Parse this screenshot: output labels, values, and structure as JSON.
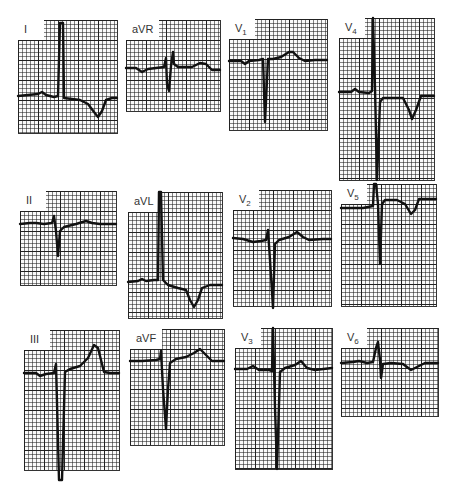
{
  "figure": {
    "leads": [
      {
        "id": "I",
        "label": "I",
        "sub": "",
        "x": 18,
        "y": 20,
        "w": 99,
        "h": 113,
        "labelW": 14
      },
      {
        "id": "aVR",
        "label": "aVR",
        "sub": "",
        "x": 126,
        "y": 20,
        "w": 94,
        "h": 91,
        "labelW": 26
      },
      {
        "id": "V1",
        "label": "V",
        "sub": "1",
        "x": 229,
        "y": 19,
        "w": 98,
        "h": 111,
        "labelW": 22
      },
      {
        "id": "V4",
        "label": "V",
        "sub": "4",
        "x": 339,
        "y": 18,
        "w": 95,
        "h": 162,
        "labelW": 22
      },
      {
        "id": "II",
        "label": "II",
        "sub": "",
        "x": 20,
        "y": 191,
        "w": 96,
        "h": 94,
        "labelW": 20
      },
      {
        "id": "aVL",
        "label": "aVL",
        "sub": "",
        "x": 128,
        "y": 192,
        "w": 94,
        "h": 126,
        "labelW": 26
      },
      {
        "id": "V2",
        "label": "V",
        "sub": "2",
        "x": 233,
        "y": 190,
        "w": 98,
        "h": 116,
        "labelW": 22
      },
      {
        "id": "V5",
        "label": "V",
        "sub": "5",
        "x": 341,
        "y": 184,
        "w": 95,
        "h": 122,
        "labelW": 22
      },
      {
        "id": "III",
        "label": "III",
        "sub": "",
        "x": 24,
        "y": 330,
        "w": 95,
        "h": 140,
        "labelW": 20
      },
      {
        "id": "aVF",
        "label": "aVF",
        "sub": "",
        "x": 130,
        "y": 329,
        "w": 94,
        "h": 116,
        "labelW": 26
      },
      {
        "id": "V3",
        "label": "V",
        "sub": "3",
        "x": 235,
        "y": 328,
        "w": 97,
        "h": 141,
        "labelW": 22
      },
      {
        "id": "V6",
        "label": "V",
        "sub": "6",
        "x": 341,
        "y": 328,
        "w": 97,
        "h": 88,
        "labelW": 22
      }
    ]
  },
  "traces": {
    "I": "M0,76 L20,74 L24,72 L28,75 L36,77 L40,76 L42,3 L45,3 L46,78 L54,79 L62,80 L70,84 L76,92 L80,97 L84,91 L88,80 L94,78 L99,78",
    "aVR": "M0,48 L10,48 L16,52 L22,49 L30,48 L38,47 L40,38 L41,64 L43,71 L45,46 L47,32 L48,44 L52,47 L66,47 L74,43 L80,44 L86,50 L94,50",
    "V1": "M0,42 L12,42 L16,45 L20,42 L30,41 L34,40 L36,103 L39,40 L44,40 L52,38 L60,33 L64,33 L70,39 L76,42 L86,41 L98,41",
    "V4": "M0,74 L12,74 L16,71 L20,74 L30,75 L33,73 L34,0 L36,70 L38,162 L41,84 L44,80 L56,80 L64,80 L70,92 L73,101 L77,92 L82,78 L95,78",
    "II": "M0,33 L10,32 L16,32 L24,33 L32,32 L34,25 L36,40 L38,65 L40,40 L44,36 L56,33 L66,30 L72,32 L80,33 L96,33",
    "aVL": "M0,90 L10,89 L14,87 L18,89 L26,88 L30,88 L31,0 L33,0 L35,88 L40,93 L50,96 L58,98 L62,108 L66,115 L70,108 L74,96 L82,93 L94,93",
    "V2": "M0,48 L10,49 L20,52 L28,51 L33,50 L35,40 L37,70 L40,118 L42,54 L46,50 L56,47 L64,42 L70,47 L76,50 L90,49 L98,49",
    "V5": "M0,24 L12,24 L22,24 L32,22 L33,0 L35,0 L37,20 L39,80 L41,20 L44,16 L56,16 L64,20 L70,30 L74,26 L78,15 L95,15",
    "III": "M0,43 L12,43 L16,46 L22,44 L30,43 L32,34 L35,150 L38,150 L41,42 L46,39 L56,36 L64,28 L70,15 L74,18 L80,42 L86,43 L95,43",
    "aVF": "M0,32 L12,32 L26,31 L30,30 L31,22 L33,60 L36,100 L38,60 L40,34 L46,30 L56,28 L64,24 L70,20 L76,26 L82,32 L94,32",
    "V3": "M0,41 L12,41 L18,38 L24,42 L34,42 L37,43 L38,0 L40,80 L42,141 L45,44 L50,40 L60,37 L66,33 L72,40 L80,42 L97,40",
    "V6": "M0,35 L12,34 L18,33 L26,35 L32,34 L35,20 L37,14 L39,32 L40,50 L42,36 L50,35 L62,36 L70,42 L76,39 L84,35 L97,35"
  }
}
